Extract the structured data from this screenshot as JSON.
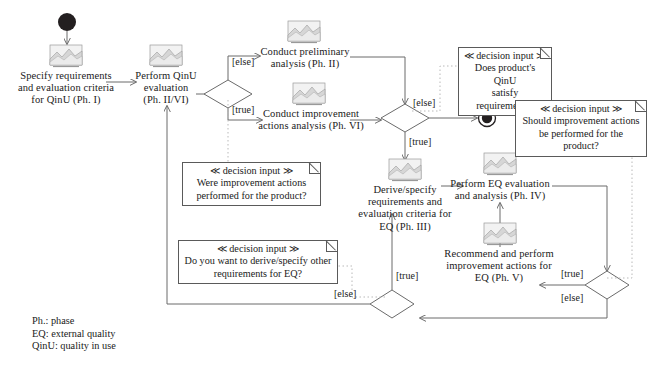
{
  "diagram": {
    "type": "uml-activity-diagram",
    "colors": {
      "line": "#6b6b6b",
      "dotted": "#b9b9b9",
      "text": "#1a1a1a",
      "note_border": "#5a5a5a",
      "node_fill": "#ffffff",
      "initial_node": "#231f20"
    },
    "nodes": {
      "initial": {
        "name": "initial-node",
        "cx": 67,
        "cy": 22,
        "r": 9
      },
      "final": {
        "name": "final-node",
        "cx": 487,
        "cy": 118,
        "r": 8
      },
      "activities": [
        {
          "id": "specify-qinu",
          "label": "Specify requirements\nand evaluation criteria\nfor QinU (Ph. I)",
          "icon": "activity-image-icon"
        },
        {
          "id": "perform-qinu",
          "label": "Perform QinU\nevaluation\n(Ph. II/VI)",
          "icon": "activity-image-icon"
        },
        {
          "id": "conduct-preliminary",
          "label": "Conduct preliminary\nanalysis (Ph. II)",
          "icon": "activity-image-icon"
        },
        {
          "id": "conduct-improvement",
          "label": "Conduct improvement\nactions analysis (Ph. VI)",
          "icon": "activity-image-icon"
        },
        {
          "id": "derive-eq",
          "label": "Derive/specify\nrequirements and\nevaluation criteria for\nEQ (Ph. III)",
          "icon": "activity-image-icon"
        },
        {
          "id": "perform-eq",
          "label": "Perform EQ evaluation\nand analysis (Ph. IV)",
          "icon": "activity-image-icon"
        },
        {
          "id": "recommend-eq",
          "label": "Recommend and perform\nimprovement actions for\nEQ (Ph. V)",
          "icon": "activity-image-icon"
        }
      ],
      "decisions": [
        {
          "id": "decision-qinu-improvement",
          "cx": 228,
          "cy": 94
        },
        {
          "id": "decision-qinu-satisfy",
          "cx": 405,
          "cy": 118
        },
        {
          "id": "decision-eq-improvement",
          "cx": 585,
          "cy": 285
        },
        {
          "id": "decision-eq-other-requirements",
          "cx": 392,
          "cy": 300
        }
      ]
    },
    "guards": [
      {
        "id": "guard-else-preliminary",
        "text": "[else]"
      },
      {
        "id": "guard-true-improvement",
        "text": "[true]"
      },
      {
        "id": "guard-else-final",
        "text": "[else]"
      },
      {
        "id": "guard-true-derive",
        "text": "[true]"
      },
      {
        "id": "guard-true-recommend",
        "text": "[true]"
      },
      {
        "id": "guard-else-eq-loop",
        "text": "[else]"
      },
      {
        "id": "guard-true-derive-again",
        "text": "[true]"
      },
      {
        "id": "guard-else-qinu-loop",
        "text": "[else]"
      }
    ],
    "notes": [
      {
        "id": "note-qinu-satisfy",
        "title": "≪ decision input ≫",
        "body": "Does product's QinU\nsatisfy requirements?"
      },
      {
        "id": "note-should-improvement",
        "title": "≪ decision input ≫",
        "body": "Should improvement actions\nbe performed for the product?"
      },
      {
        "id": "note-were-improvement",
        "title": "≪ decision input ≫",
        "body": "Were improvement actions\nperformed for the product?"
      },
      {
        "id": "note-derive-other",
        "title": "≪ decision input ≫",
        "body": "Do you want to derive/specify other\nrequirements for EQ?"
      }
    ],
    "legend": {
      "id": "legend-abbreviations",
      "text": "Ph.: phase\nEQ: external quality\nQinU: quality in use"
    }
  }
}
